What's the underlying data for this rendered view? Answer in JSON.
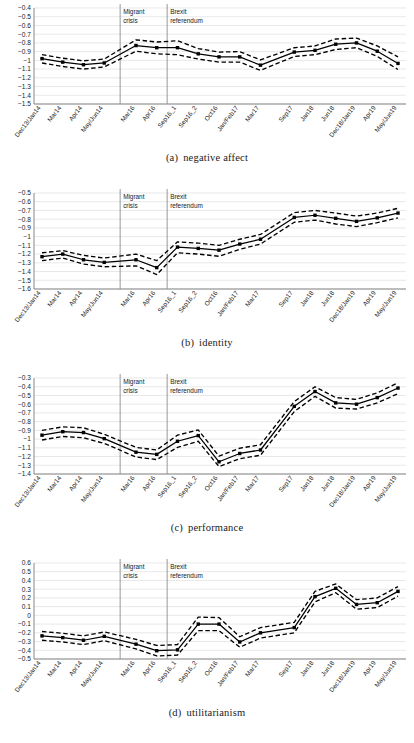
{
  "figure": {
    "categories": [
      "Dec13/Jan14",
      "Mar14",
      "Apr14",
      "May/Jun14",
      "Mar16",
      "Apr16",
      "Sep16_1",
      "Sep16_2",
      "Oct16",
      "Jan/Feb17",
      "Mar17",
      "Sep17",
      "Jan18",
      "Jun18",
      "Dec18/Jan19",
      "Apr19",
      "May/Jun19"
    ],
    "annotations": [
      {
        "name": "migrant-crisis",
        "line1": "Migrant",
        "line2": "crisis",
        "after_index": 3
      },
      {
        "name": "brexit-referendum",
        "line1": "Brexit",
        "line2": "referendum",
        "after_index": 5
      }
    ],
    "gap_after_index": 3,
    "gap2_after_index": 10,
    "colors": {
      "line": "#000000",
      "grid": "#d9d9d9",
      "axis": "#7a7a7a",
      "vline": "#8c8c8c",
      "background": "#ffffff"
    }
  },
  "chart_data": [
    {
      "type": "line",
      "panel": "a",
      "title": "negative affect",
      "caption_label": "(a)",
      "xlabel": "",
      "ylabel": "",
      "ylim": [
        -1.5,
        -0.4
      ],
      "ytick_step": 0.1,
      "grid": true,
      "legend": "none",
      "categories": [
        "Dec13/Jan14",
        "Mar14",
        "Apr14",
        "May/Jun14",
        "Mar16",
        "Apr16",
        "Sep16_1",
        "Sep16_2",
        "Oct16",
        "Jan/Feb17",
        "Mar17",
        "Sep17",
        "Jan18",
        "Jun18",
        "Dec18/Jan19",
        "Apr19",
        "May/Jun19"
      ],
      "yticks": [
        -0.4,
        -0.5,
        -0.6,
        -0.7,
        -0.8,
        -0.9,
        -1.0,
        -1.1,
        -1.2,
        -1.3,
        -1.4,
        -1.5
      ],
      "ytick_labels": [
        "−0.4",
        "−0.5",
        "−0.6",
        "−0.7",
        "−0.8",
        "−0.9",
        "−1",
        "−1.1",
        "−1.2",
        "−1.3",
        "−1.4",
        "−1.5"
      ],
      "series": [
        {
          "name": "estimate",
          "values": [
            -0.98,
            -1.02,
            -1.05,
            -1.03,
            -0.83,
            -0.855,
            -0.855,
            -0.925,
            -0.96,
            -0.96,
            -1.055,
            -0.905,
            -0.885,
            -0.815,
            -0.8,
            -0.895,
            -1.035
          ]
        },
        {
          "name": "ci_upper",
          "values": [
            -0.935,
            -0.975,
            -1.005,
            -0.985,
            -0.765,
            -0.79,
            -0.775,
            -0.865,
            -0.905,
            -0.9,
            -0.995,
            -0.855,
            -0.835,
            -0.755,
            -0.745,
            -0.835,
            -0.96
          ]
        },
        {
          "name": "ci_lower",
          "values": [
            -1.03,
            -1.07,
            -1.1,
            -1.075,
            -0.895,
            -0.925,
            -0.935,
            -0.985,
            -1.02,
            -1.02,
            -1.115,
            -0.955,
            -0.935,
            -0.875,
            -0.855,
            -0.955,
            -1.105
          ]
        }
      ]
    },
    {
      "type": "line",
      "panel": "b",
      "title": "identity",
      "caption_label": "(b)",
      "xlabel": "",
      "ylabel": "",
      "ylim": [
        -1.6,
        -0.5
      ],
      "ytick_step": 0.1,
      "grid": true,
      "legend": "none",
      "categories": [
        "Dec13/Jan14",
        "Mar14",
        "Apr14",
        "May/Jun14",
        "Mar16",
        "Apr16",
        "Sep16_1",
        "Sep16_2",
        "Oct16",
        "Jan/Feb17",
        "Mar17",
        "Sep17",
        "Jan18",
        "Jun18",
        "Dec18/Jan19",
        "Apr19",
        "May/Jun19"
      ],
      "yticks": [
        -0.5,
        -0.6,
        -0.7,
        -0.8,
        -0.9,
        -1.0,
        -1.1,
        -1.2,
        -1.3,
        -1.4,
        -1.5,
        -1.6
      ],
      "ytick_labels": [
        "−0.5",
        "−0.6",
        "−0.7",
        "−0.8",
        "−0.9",
        "−1",
        "−1.1",
        "−1.2",
        "−1.3",
        "−1.4",
        "−1.5",
        "−1.6"
      ],
      "series": [
        {
          "name": "estimate",
          "values": [
            -1.23,
            -1.2,
            -1.265,
            -1.295,
            -1.265,
            -1.355,
            -1.12,
            -1.135,
            -1.155,
            -1.085,
            -1.03,
            -0.78,
            -0.755,
            -0.79,
            -0.825,
            -0.785,
            -0.73
          ]
        },
        {
          "name": "ci_upper",
          "values": [
            -1.185,
            -1.16,
            -1.215,
            -1.245,
            -1.2,
            -1.275,
            -1.06,
            -1.075,
            -1.1,
            -1.03,
            -0.975,
            -0.725,
            -0.7,
            -0.73,
            -0.765,
            -0.73,
            -0.675
          ]
        },
        {
          "name": "ci_lower",
          "values": [
            -1.275,
            -1.245,
            -1.315,
            -1.345,
            -1.335,
            -1.435,
            -1.185,
            -1.2,
            -1.225,
            -1.145,
            -1.085,
            -0.835,
            -0.81,
            -0.855,
            -0.885,
            -0.84,
            -0.785
          ]
        }
      ]
    },
    {
      "type": "line",
      "panel": "c",
      "title": "performance",
      "caption_label": "(c)",
      "xlabel": "",
      "ylabel": "",
      "ylim": [
        -1.4,
        -0.3
      ],
      "ytick_step": 0.1,
      "grid": true,
      "legend": "none",
      "categories": [
        "Dec13/Jan14",
        "Mar14",
        "Apr14",
        "May/Jun14",
        "Mar16",
        "Apr16",
        "Sep16_1",
        "Sep16_2",
        "Oct16",
        "Jan/Feb17",
        "Mar17",
        "Sep17",
        "Jan18",
        "Jun18",
        "Dec18/Jan19",
        "Apr19",
        "May/Jun19"
      ],
      "yticks": [
        -0.3,
        -0.4,
        -0.5,
        -0.6,
        -0.7,
        -0.8,
        -0.9,
        -1.0,
        -1.1,
        -1.2,
        -1.3,
        -1.4
      ],
      "ytick_labels": [
        "−0.3",
        "−0.4",
        "−0.5",
        "−0.6",
        "−0.7",
        "−0.8",
        "−0.9",
        "−1",
        "−1.1",
        "−1.2",
        "−1.3",
        "−1.4"
      ],
      "series": [
        {
          "name": "estimate",
          "values": [
            -0.955,
            -0.915,
            -0.925,
            -0.995,
            -1.15,
            -1.175,
            -1.025,
            -0.96,
            -1.26,
            -1.165,
            -1.125,
            -0.625,
            -0.455,
            -0.585,
            -0.6,
            -0.525,
            -0.415
          ]
        },
        {
          "name": "ci_upper",
          "values": [
            -0.9,
            -0.86,
            -0.87,
            -0.945,
            -1.095,
            -1.125,
            -0.955,
            -0.895,
            -1.195,
            -1.105,
            -1.065,
            -0.57,
            -0.4,
            -0.525,
            -0.545,
            -0.47,
            -0.355
          ]
        },
        {
          "name": "ci_lower",
          "values": [
            -1.01,
            -0.97,
            -0.985,
            -1.05,
            -1.205,
            -1.235,
            -1.095,
            -1.025,
            -1.315,
            -1.225,
            -1.185,
            -0.685,
            -0.51,
            -0.645,
            -0.655,
            -0.585,
            -0.48
          ]
        }
      ]
    },
    {
      "type": "line",
      "panel": "d",
      "title": "utilitarianism",
      "caption_label": "(d)",
      "xlabel": "",
      "ylabel": "",
      "ylim": [
        -0.5,
        0.6
      ],
      "ytick_step": 0.1,
      "grid": true,
      "legend": "none",
      "categories": [
        "Dec13/Jan14",
        "Mar14",
        "Apr14",
        "May/Jun14",
        "Mar16",
        "Apr16",
        "Sep16_1",
        "Sep16_2",
        "Oct16",
        "Jan/Feb17",
        "Mar17",
        "Sep17",
        "Jan18",
        "Jun18",
        "Dec18/Jan19",
        "Apr19",
        "May/Jun19"
      ],
      "yticks": [
        0.6,
        0.5,
        0.4,
        0.3,
        0.2,
        0.1,
        0,
        -0.1,
        -0.2,
        -0.3,
        -0.4,
        -0.5
      ],
      "ytick_labels": [
        "0.6",
        "0.5",
        "0.4",
        "0.3",
        "0.2",
        "0.1",
        "0",
        "−0.1",
        "−0.2",
        "−0.3",
        "−0.4",
        "−0.5"
      ],
      "series": [
        {
          "name": "estimate",
          "values": [
            -0.235,
            -0.255,
            -0.285,
            -0.24,
            -0.33,
            -0.405,
            -0.395,
            -0.1,
            -0.1,
            -0.305,
            -0.2,
            -0.14,
            0.215,
            0.31,
            0.125,
            0.145,
            0.275,
            0.425
          ]
        },
        {
          "name": "ci_upper",
          "values": [
            -0.185,
            -0.205,
            -0.235,
            -0.19,
            -0.275,
            -0.345,
            -0.335,
            -0.02,
            -0.025,
            -0.245,
            -0.14,
            -0.08,
            0.275,
            0.36,
            0.18,
            0.2,
            0.33,
            0.49
          ]
        },
        {
          "name": "ci_lower",
          "values": [
            -0.285,
            -0.305,
            -0.335,
            -0.29,
            -0.385,
            -0.465,
            -0.455,
            -0.175,
            -0.175,
            -0.365,
            -0.26,
            -0.2,
            0.155,
            0.26,
            0.07,
            0.09,
            0.22,
            0.36
          ]
        }
      ]
    }
  ]
}
